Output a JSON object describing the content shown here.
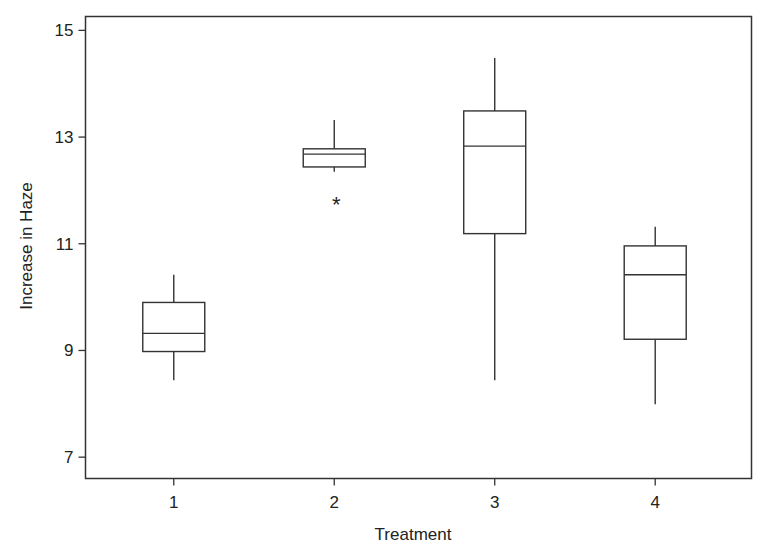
{
  "chart_data": {
    "type": "boxplot",
    "title": "",
    "xlabel": "Treatment",
    "ylabel": "Increase in Haze",
    "categories": [
      "1",
      "2",
      "3",
      "4"
    ],
    "xlim": [
      0.45,
      4.6
    ],
    "ylim": [
      6.6,
      15.26
    ],
    "yticks": [
      7,
      9,
      11,
      13,
      15
    ],
    "ytick_labels": [
      "7",
      "9",
      "11",
      "13",
      "15"
    ],
    "grid": false,
    "legend": "none",
    "series": [
      {
        "name": "1",
        "whisker_low": 8.44,
        "q1": 8.98,
        "median": 9.32,
        "q3": 9.9,
        "whisker_high": 10.42,
        "outliers": []
      },
      {
        "name": "2",
        "whisker_low": 12.35,
        "q1": 12.44,
        "median": 12.68,
        "q3": 12.78,
        "whisker_high": 13.32,
        "outliers": [
          11.82
        ]
      },
      {
        "name": "3",
        "whisker_low": 8.44,
        "q1": 11.19,
        "median": 12.83,
        "q3": 13.49,
        "whisker_high": 14.48,
        "outliers": []
      },
      {
        "name": "4",
        "whisker_low": 7.99,
        "q1": 9.21,
        "median": 10.42,
        "q3": 10.96,
        "whisker_high": 11.32,
        "outliers": []
      }
    ],
    "outlier_marker": "*"
  }
}
